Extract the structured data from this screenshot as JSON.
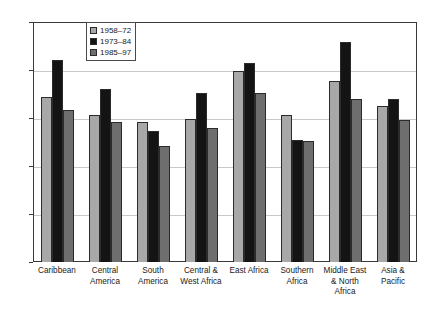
{
  "chart_data": {
    "type": "bar",
    "title": "",
    "xlabel": "",
    "ylabel": "",
    "ylim": [
      0,
      25
    ],
    "ytick_labels": [
      "0%",
      "5%",
      "10%",
      "15%",
      "20%",
      "25%"
    ],
    "ytick_values": [
      0,
      5,
      10,
      15,
      20,
      25
    ],
    "grid": true,
    "legend_position": "top-center",
    "categories": [
      "Caribbean",
      "Central\nAmerica",
      "South\nAmerica",
      "Central &\nWest Africa",
      "East Africa",
      "Southern\nAfrica",
      "Middle East\n& North\nAfrica",
      "Asia &\nPacific"
    ],
    "series": [
      {
        "name": "1958–72",
        "color": "#a8a8a8",
        "values": [
          17.2,
          15.3,
          14.6,
          14.9,
          19.9,
          15.3,
          18.9,
          16.2
        ]
      },
      {
        "name": "1973–84",
        "color": "#141414",
        "values": [
          21.0,
          18.0,
          13.6,
          17.6,
          20.7,
          12.7,
          22.9,
          17.0
        ]
      },
      {
        "name": "1985–97",
        "color": "#6e6e6e",
        "values": [
          15.8,
          14.6,
          12.1,
          14.0,
          17.6,
          12.6,
          17.0,
          14.8
        ]
      }
    ]
  }
}
